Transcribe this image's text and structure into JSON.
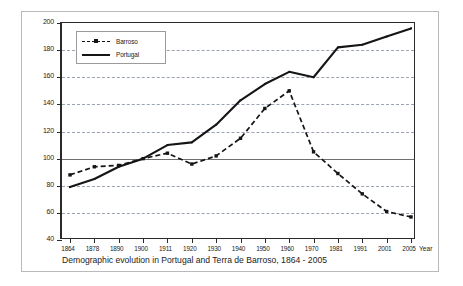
{
  "figure": {
    "title": "indices, 1900 = 100",
    "caption": "Demographic evolution in Portugal and Terra de Barroso, 1864 - 2005",
    "x_axis_title": "Year"
  },
  "legend": {
    "position": "top-left-inside",
    "items": [
      {
        "label": "Barroso",
        "style": "dashed-with-square-markers",
        "color": "#151515"
      },
      {
        "label": "Portugal",
        "style": "solid",
        "color": "#151515"
      }
    ]
  },
  "axis": {
    "y_ticks": [
      "200",
      "180",
      "160",
      "140",
      "120",
      "100",
      "80",
      "60",
      "40"
    ],
    "x_ticks": [
      "1864",
      "1878",
      "1890",
      "1900",
      "1911",
      "1920",
      "1930",
      "1940",
      "1950",
      "1960",
      "1970",
      "1981",
      "1991",
      "2001",
      "2005"
    ]
  },
  "chart_data": {
    "type": "line",
    "title": "indices, 1900 = 100",
    "subtitle": "Demographic evolution in Portugal and Terra de Barroso, 1864 - 2005",
    "xlabel": "Year",
    "ylabel": "",
    "ylim": [
      40,
      200
    ],
    "ytick_step": 20,
    "grid": "horizontal-dashed",
    "reference_line": 100,
    "legend_position": "upper left",
    "categories": [
      "1864",
      "1878",
      "1890",
      "1900",
      "1911",
      "1920",
      "1930",
      "1940",
      "1950",
      "1960",
      "1970",
      "1981",
      "1991",
      "2001",
      "2005"
    ],
    "series": [
      {
        "name": "Barroso",
        "style": "dashed",
        "marker": "square",
        "color": "#151515",
        "values": [
          88,
          94,
          95,
          100,
          104,
          96,
          102,
          115,
          137,
          150,
          105,
          89,
          74,
          61,
          57
        ]
      },
      {
        "name": "Portugal",
        "style": "solid",
        "marker": "none",
        "color": "#151515",
        "values": [
          79,
          85,
          94,
          100,
          110,
          112,
          125,
          143,
          155,
          164,
          160,
          182,
          184,
          190,
          196
        ]
      }
    ]
  }
}
